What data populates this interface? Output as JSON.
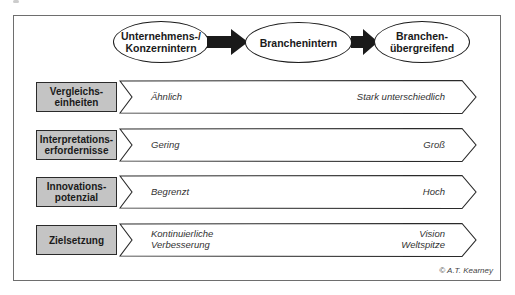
{
  "diagram": {
    "stages": [
      {
        "line1": "Unternehmens-/",
        "line2": "Konzernintern"
      },
      {
        "line1": "Branchenintern",
        "line2": ""
      },
      {
        "line1": "Branchen-",
        "line2": "übergreifend"
      }
    ],
    "rows": [
      {
        "label_line1": "Vergleichs-",
        "label_line2": "einheiten",
        "left_line1": "Ähnlich",
        "left_line2": "",
        "right_line1": "Stark unterschiedlich",
        "right_line2": ""
      },
      {
        "label_line1": "Interpretations-",
        "label_line2": "erfordernisse",
        "left_line1": "Gering",
        "left_line2": "",
        "right_line1": "Groß",
        "right_line2": ""
      },
      {
        "label_line1": "Innovations-",
        "label_line2": "potenzial",
        "left_line1": "Begrenzt",
        "left_line2": "",
        "right_line1": "Hoch",
        "right_line2": ""
      },
      {
        "label_line1": "Zielsetzung",
        "label_line2": "",
        "left_line1": "Kontinuierliche",
        "left_line2": "Verbesserung",
        "right_line1": "Vision",
        "right_line2": "Weltspitze"
      }
    ],
    "credit": "© A.T. Kearney",
    "colors": {
      "label_fill": "#c4c4c4",
      "arrow_fill": "#1a1a1a",
      "frame": "#6e6e6e"
    }
  }
}
